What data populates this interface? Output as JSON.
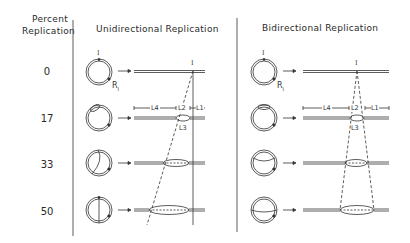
{
  "headers": {
    "percent_line1": "Percent",
    "percent_line2": "Replication",
    "unidirectional": "Unidirectional Replication",
    "bidirectional": "Bidirectional Replication"
  },
  "rows": [
    {
      "percent": "0"
    },
    {
      "percent": "17"
    },
    {
      "percent": "33"
    },
    {
      "percent": "50"
    }
  ],
  "labels": {
    "origin": "I",
    "terminus": "R",
    "terminus_sub": "I",
    "L1": "L1",
    "L2": "L2",
    "L3": "L3",
    "L4": "L4"
  },
  "colors": {
    "ink": "#333333",
    "background": "#ffffff"
  }
}
